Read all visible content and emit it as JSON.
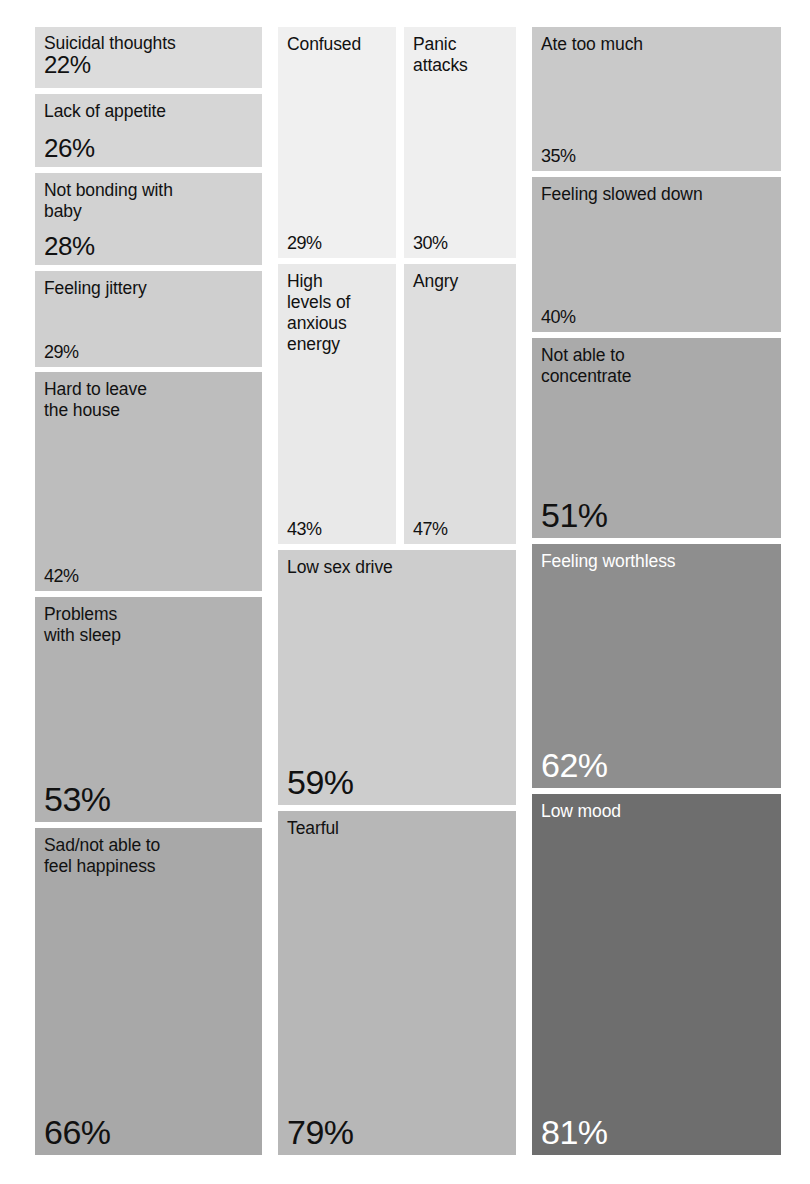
{
  "chart_data": {
    "type": "treemap",
    "title": "",
    "subtitle": "",
    "xlabel": "",
    "ylabel": "",
    "legend_position": "none",
    "grid": false,
    "value_unit": "%",
    "value_range": [
      22,
      81
    ],
    "color_encoding": "gray shade: lighter = lower percentage, darker = higher percentage",
    "categories": [
      "Suicidal thoughts",
      "Lack of appetite",
      "Not bonding with baby",
      "Feeling jittery",
      "Hard to leave the house",
      "Problems with sleep",
      "Sad/not able to feel happiness",
      "Confused",
      "Panic attacks",
      "High levels of anxious energy",
      "Angry",
      "Low sex drive",
      "Tearful",
      "Ate too much",
      "Feeling slowed down",
      "Not able to concentrate",
      "Feeling worthless",
      "Low mood"
    ],
    "values": [
      22,
      26,
      28,
      29,
      42,
      53,
      66,
      29,
      30,
      43,
      47,
      59,
      79,
      35,
      40,
      51,
      62,
      81
    ]
  },
  "tiles": [
    {
      "id": "suicidal-thoughts",
      "label": "Suicidal thoughts",
      "value": "22%",
      "x": 35,
      "y": 27,
      "w": 227,
      "h": 61,
      "color": "#dcdcdc",
      "light_text": false,
      "size": "stacked"
    },
    {
      "id": "lack-of-appetite",
      "label": "Lack of appetite",
      "value": "26%",
      "x": 35,
      "y": 94,
      "w": 227,
      "h": 73,
      "color": "#d6d6d6",
      "light_text": false,
      "size": "v-md"
    },
    {
      "id": "not-bonding-with-baby",
      "label": "Not bonding with\nbaby",
      "value": "28%",
      "x": 35,
      "y": 173,
      "w": 227,
      "h": 92,
      "color": "#d2d2d2",
      "light_text": false,
      "size": "v-md"
    },
    {
      "id": "feeling-jittery",
      "label": "Feeling jittery",
      "value": "29%",
      "x": 35,
      "y": 271,
      "w": 227,
      "h": 96,
      "color": "#cfcfcf",
      "light_text": false,
      "size": "v-sm"
    },
    {
      "id": "hard-to-leave-the-house",
      "label": "Hard to leave\nthe house",
      "value": "42%",
      "x": 35,
      "y": 372,
      "w": 227,
      "h": 219,
      "color": "#bdbdbd",
      "light_text": false,
      "size": "v-sm"
    },
    {
      "id": "problems-with-sleep",
      "label": "Problems\nwith sleep",
      "value": "53%",
      "x": 35,
      "y": 597,
      "w": 227,
      "h": 225,
      "color": "#b2b2b2",
      "light_text": false,
      "size": "v-lg"
    },
    {
      "id": "sad-not-able-to-feel-happiness",
      "label": "Sad/not able to\nfeel happiness",
      "value": "66%",
      "x": 35,
      "y": 828,
      "w": 227,
      "h": 327,
      "color": "#a8a8a8",
      "light_text": false,
      "size": "v-lg"
    },
    {
      "id": "confused",
      "label": "Confused",
      "value": "29%",
      "x": 278,
      "y": 27,
      "w": 118,
      "h": 231,
      "color": "#f0f0f0",
      "light_text": false,
      "size": "v-sm"
    },
    {
      "id": "panic-attacks",
      "label": "Panic\nattacks",
      "value": "30%",
      "x": 404,
      "y": 27,
      "w": 112,
      "h": 231,
      "color": "#efefef",
      "light_text": false,
      "size": "v-sm"
    },
    {
      "id": "high-levels-of-anxious-energy",
      "label": "High\nlevels of\nanxious\nenergy",
      "value": "43%",
      "x": 278,
      "y": 264,
      "w": 118,
      "h": 280,
      "color": "#e9e9e9",
      "light_text": false,
      "size": "v-sm"
    },
    {
      "id": "angry",
      "label": "Angry",
      "value": "47%",
      "x": 404,
      "y": 264,
      "w": 112,
      "h": 280,
      "color": "#dedede",
      "light_text": false,
      "size": "v-sm"
    },
    {
      "id": "low-sex-drive",
      "label": "Low sex drive",
      "value": "59%",
      "x": 278,
      "y": 550,
      "w": 238,
      "h": 255,
      "color": "#cdcdcd",
      "light_text": false,
      "size": "v-lg"
    },
    {
      "id": "tearful",
      "label": "Tearful",
      "value": "79%",
      "x": 278,
      "y": 811,
      "w": 238,
      "h": 344,
      "color": "#b7b7b7",
      "light_text": false,
      "size": "v-lg"
    },
    {
      "id": "ate-too-much",
      "label": "Ate too much",
      "value": "35%",
      "x": 532,
      "y": 27,
      "w": 249,
      "h": 144,
      "color": "#c9c9c9",
      "light_text": false,
      "size": "v-sm"
    },
    {
      "id": "feeling-slowed-down",
      "label": "Feeling slowed down",
      "value": "40%",
      "x": 532,
      "y": 177,
      "w": 249,
      "h": 155,
      "color": "#b9b9b9",
      "light_text": false,
      "size": "v-sm"
    },
    {
      "id": "not-able-to-concentrate",
      "label": "Not able to\nconcentrate",
      "value": "51%",
      "x": 532,
      "y": 338,
      "w": 249,
      "h": 200,
      "color": "#aaaaaa",
      "light_text": false,
      "size": "v-lg"
    },
    {
      "id": "feeling-worthless",
      "label": "Feeling worthless",
      "value": "62%",
      "x": 532,
      "y": 544,
      "w": 249,
      "h": 244,
      "color": "#8e8e8e",
      "light_text": true,
      "size": "v-lg"
    },
    {
      "id": "low-mood",
      "label": "Low mood",
      "value": "81%",
      "x": 532,
      "y": 794,
      "w": 249,
      "h": 361,
      "color": "#6e6e6e",
      "light_text": true,
      "size": "v-lg"
    }
  ]
}
